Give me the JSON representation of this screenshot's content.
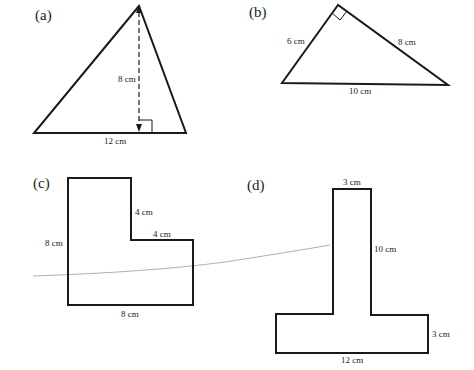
{
  "figures": {
    "a": {
      "label": "(a)",
      "shape": "triangle",
      "height_label": "8 cm",
      "base_label": "12 cm"
    },
    "b": {
      "label": "(b)",
      "shape": "right-triangle",
      "left_side_label": "6 cm",
      "right_side_label": "8 cm",
      "hypotenuse_label": "10 cm"
    },
    "c": {
      "label": "(c)",
      "shape": "L-shape",
      "left_side_label": "8 cm",
      "inner_vertical_label": "4 cm",
      "inner_horizontal_label": "4 cm",
      "bottom_label": "8 cm"
    },
    "d": {
      "label": "(d)",
      "shape": "T-shape",
      "top_label": "3 cm",
      "stem_height_label": "10 cm",
      "base_height_label": "3 cm",
      "base_width_label": "12 cm"
    }
  }
}
